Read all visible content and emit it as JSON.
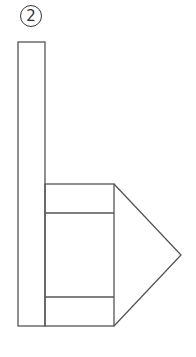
{
  "figure": {
    "label": "2",
    "stroke_color": "#555555",
    "background": "#ffffff"
  },
  "shapes": {
    "post": {
      "x": 18,
      "y": 42,
      "width": 27,
      "height": 284
    },
    "box": {
      "x": 45,
      "y": 184,
      "width": 69,
      "height": 142,
      "band_top_y": 213,
      "band_bottom_y": 297
    },
    "arrow_tip": {
      "x": 181,
      "y": 255
    }
  }
}
